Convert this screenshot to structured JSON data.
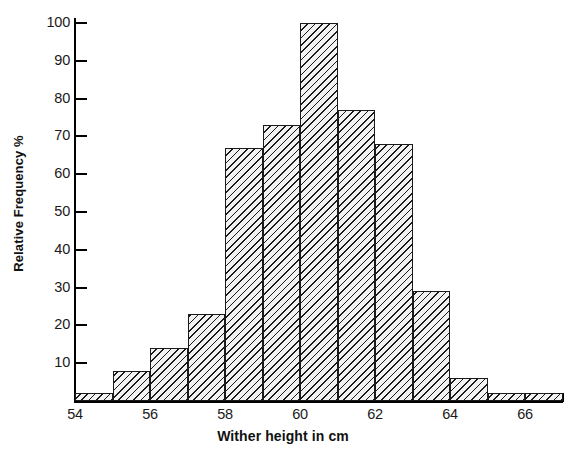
{
  "chart_data": {
    "type": "bar",
    "title": "",
    "xlabel": "Wither height in cm",
    "ylabel": "Relative Frequency %",
    "xlim": [
      54,
      67
    ],
    "ylim": [
      0,
      100
    ],
    "grid": false,
    "legend": "none",
    "bin_width": 1,
    "x_tick_labels": [
      "54",
      "56",
      "58",
      "60",
      "62",
      "64",
      "66"
    ],
    "x_tick_values": [
      54,
      56,
      58,
      60,
      62,
      64,
      66
    ],
    "y_tick_labels": [
      "10",
      "20",
      "30",
      "40",
      "50",
      "60",
      "70",
      "80",
      "90",
      "100"
    ],
    "y_tick_values": [
      10,
      20,
      30,
      40,
      50,
      60,
      70,
      80,
      90,
      100
    ],
    "categories": [
      "54-55",
      "55-56",
      "56-57",
      "57-58",
      "58-59",
      "59-60",
      "60-61",
      "61-62",
      "62-63",
      "63-64",
      "64-65",
      "65-66",
      "66-67"
    ],
    "bins": [
      {
        "start": 54,
        "end": 55,
        "value": 2
      },
      {
        "start": 55,
        "end": 56,
        "value": 8
      },
      {
        "start": 56,
        "end": 57,
        "value": 14
      },
      {
        "start": 57,
        "end": 58,
        "value": 23
      },
      {
        "start": 58,
        "end": 59,
        "value": 67
      },
      {
        "start": 59,
        "end": 60,
        "value": 73
      },
      {
        "start": 60,
        "end": 61,
        "value": 100
      },
      {
        "start": 61,
        "end": 62,
        "value": 77
      },
      {
        "start": 62,
        "end": 63,
        "value": 68
      },
      {
        "start": 63,
        "end": 64,
        "value": 29
      },
      {
        "start": 64,
        "end": 65,
        "value": 6
      },
      {
        "start": 65,
        "end": 66,
        "value": 2
      },
      {
        "start": 66,
        "end": 67,
        "value": 2
      }
    ],
    "values": [
      2,
      8,
      14,
      23,
      67,
      73,
      100,
      77,
      68,
      29,
      6,
      2,
      2
    ],
    "bar_style": {
      "fill": "#f2f2f2",
      "hatch": "diagonal-left",
      "edge": "#1a1a1a"
    }
  }
}
